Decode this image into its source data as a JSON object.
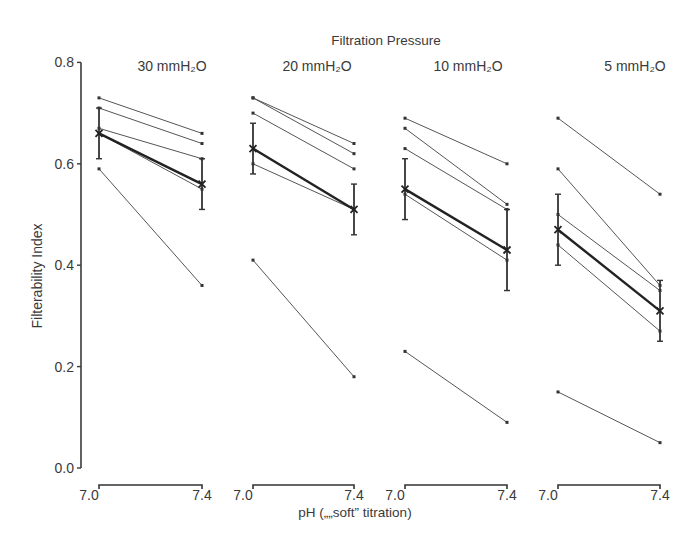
{
  "chart_data": {
    "type": "line",
    "title": "Filtration Pressure",
    "ylabel": "Filterability Index",
    "xlabel": "pH („„soft” titration)",
    "ylim": [
      0.0,
      0.8
    ],
    "yticks": [
      "0.0",
      "0.2",
      "0.4",
      "0.6",
      "0.8"
    ],
    "grid": false,
    "legend": null,
    "panels": [
      {
        "label": "30 mmH₂O",
        "x": [
          "7.0",
          "7.4"
        ],
        "individuals": [
          [
            0.73,
            0.66
          ],
          [
            0.71,
            0.64
          ],
          [
            0.67,
            0.61
          ],
          [
            0.66,
            0.55
          ],
          [
            0.59,
            0.36
          ]
        ],
        "mean": [
          0.66,
          0.56
        ],
        "error": [
          [
            0.61,
            0.71
          ],
          [
            0.51,
            0.61
          ]
        ]
      },
      {
        "label": "20 mmH₂O",
        "x": [
          "7.0",
          "7.4"
        ],
        "individuals": [
          [
            0.73,
            0.64
          ],
          [
            0.73,
            0.62
          ],
          [
            0.7,
            0.59
          ],
          [
            0.6,
            0.51
          ],
          [
            0.41,
            0.18
          ]
        ],
        "mean": [
          0.63,
          0.51
        ],
        "error": [
          [
            0.58,
            0.68
          ],
          [
            0.46,
            0.56
          ]
        ]
      },
      {
        "label": "10 mmH₂O",
        "x": [
          "7.0",
          "7.4"
        ],
        "individuals": [
          [
            0.69,
            0.6
          ],
          [
            0.67,
            0.52
          ],
          [
            0.63,
            0.51
          ],
          [
            0.54,
            0.41
          ],
          [
            0.23,
            0.09
          ]
        ],
        "mean": [
          0.55,
          0.43
        ],
        "error": [
          [
            0.49,
            0.61
          ],
          [
            0.35,
            0.51
          ]
        ]
      },
      {
        "label": "5 mmH₂O",
        "x": [
          "7.0",
          "7.4"
        ],
        "individuals": [
          [
            0.69,
            0.54
          ],
          [
            0.59,
            0.36
          ],
          [
            0.5,
            0.35
          ],
          [
            0.44,
            0.27
          ],
          [
            0.15,
            0.05
          ]
        ],
        "mean": [
          0.47,
          0.31
        ],
        "error": [
          [
            0.4,
            0.54
          ],
          [
            0.25,
            0.37
          ]
        ]
      }
    ]
  },
  "labels": {
    "title": "Filtration Pressure",
    "ylabel": "Filterability Index",
    "xlabel": "pH („„soft” titration)",
    "yticks": [
      "0.0",
      "0.2",
      "0.4",
      "0.6",
      "0.8"
    ],
    "xticks": [
      "7.0",
      "7.4"
    ]
  }
}
